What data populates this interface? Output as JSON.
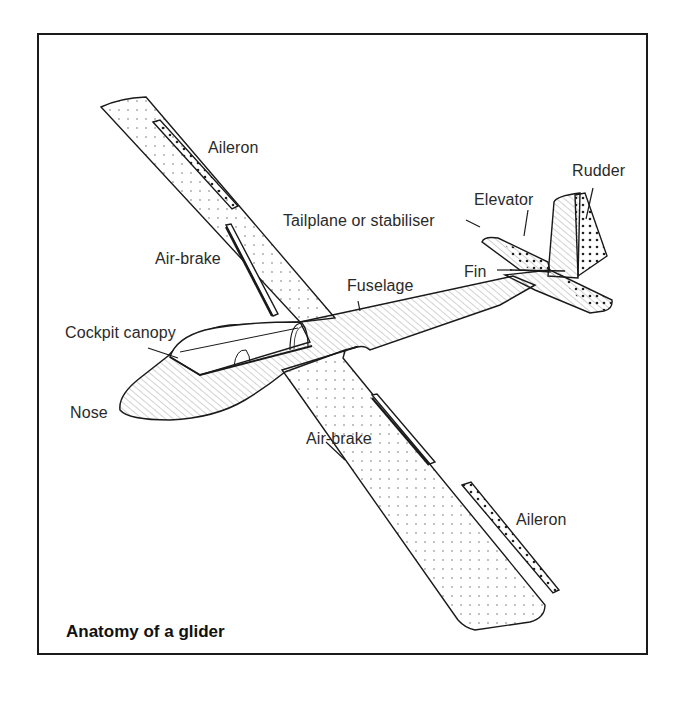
{
  "figure": {
    "caption": "Anatomy of a glider",
    "labels": {
      "aileron_upper": "Aileron",
      "air_brake_upper": "Air-brake",
      "tailplane": "Tailplane or stabiliser",
      "elevator": "Elevator",
      "rudder": "Rudder",
      "fin": "Fin",
      "fuselage": "Fuselage",
      "cockpit_canopy": "Cockpit canopy",
      "nose": "Nose",
      "air_brake_lower": "Air-brake",
      "aileron_lower": "Aileron"
    },
    "colors": {
      "ink": "#1a1a1a",
      "background": "#ffffff"
    }
  }
}
